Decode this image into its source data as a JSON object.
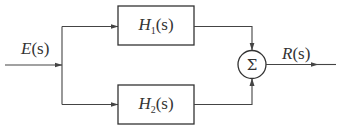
{
  "diagram": {
    "type": "block-diagram",
    "input_signal": {
      "label": "E(s)",
      "name": "E",
      "arg": "(s)"
    },
    "output_signal": {
      "label": "R(s)",
      "name": "R",
      "arg": "(s)"
    },
    "blocks": [
      {
        "id": "H1",
        "label": "H1(s)",
        "name": "H",
        "subscript": "1",
        "arg": "(s)"
      },
      {
        "id": "H2",
        "label": "H2(s)",
        "name": "H",
        "subscript": "2",
        "arg": "(s)"
      }
    ],
    "summing_junction": {
      "symbol": "Σ",
      "inputs": [
        "H1",
        "H2"
      ]
    },
    "connections": [
      [
        "E(s)",
        "branch-point"
      ],
      [
        "branch-point",
        "H1"
      ],
      [
        "branch-point",
        "H2"
      ],
      [
        "H1",
        "Σ"
      ],
      [
        "H2",
        "Σ"
      ],
      [
        "Σ",
        "R(s)"
      ]
    ],
    "colors": {
      "line": "#444444",
      "text": "#333333",
      "background": "#ffffff"
    }
  }
}
